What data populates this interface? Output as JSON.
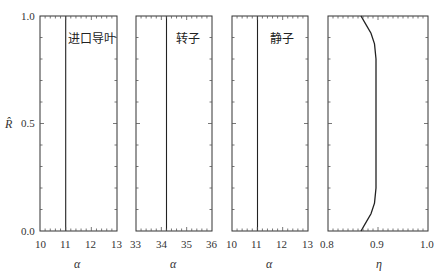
{
  "chart_data": [
    {
      "type": "line",
      "panel": 1,
      "title": "进口导叶",
      "xlabel": "α",
      "ylabel": "R̂",
      "xlim": [
        10,
        13
      ],
      "ylim": [
        0.0,
        1.0
      ],
      "xticks": [
        "10",
        "11",
        "12",
        "13"
      ],
      "yticks": [
        "0.0",
        "0.5",
        "1.0"
      ],
      "series": [
        {
          "name": "alpha",
          "x": [
            11.0,
            11.0
          ],
          "y": [
            0.0,
            1.0
          ]
        }
      ]
    },
    {
      "type": "line",
      "panel": 2,
      "title": "转子",
      "xlabel": "α",
      "xlim": [
        33,
        36
      ],
      "ylim": [
        0.0,
        1.0
      ],
      "xticks": [
        "33",
        "34",
        "35",
        "36"
      ],
      "series": [
        {
          "name": "alpha",
          "x": [
            34.2,
            34.2
          ],
          "y": [
            0.0,
            1.0
          ]
        }
      ]
    },
    {
      "type": "line",
      "panel": 3,
      "title": "静子",
      "xlabel": "α",
      "xlim": [
        10,
        13
      ],
      "ylim": [
        0.0,
        1.0
      ],
      "xticks": [
        "10",
        "11",
        "12",
        "13"
      ],
      "series": [
        {
          "name": "alpha",
          "x": [
            11.0,
            11.0
          ],
          "y": [
            0.0,
            1.0
          ]
        }
      ]
    },
    {
      "type": "line",
      "panel": 4,
      "title": "",
      "xlabel": "η",
      "xlim": [
        0.8,
        1.0
      ],
      "ylim": [
        0.0,
        1.0
      ],
      "xticks": [
        "0.8",
        "0.9",
        "1.0"
      ],
      "series": [
        {
          "name": "eta",
          "x": [
            0.866,
            0.876,
            0.886,
            0.893,
            0.896,
            0.896,
            0.896,
            0.893,
            0.886,
            0.876,
            0.866
          ],
          "y": [
            0.0,
            0.04,
            0.08,
            0.13,
            0.2,
            0.5,
            0.8,
            0.87,
            0.92,
            0.96,
            1.0
          ]
        }
      ]
    }
  ],
  "labels": {
    "ylabel": "R̂",
    "p1_title": "进口导叶",
    "p2_title": "转子",
    "p3_title": "静子",
    "p1_xlabel": "α",
    "p2_xlabel": "α",
    "p3_xlabel": "α",
    "p4_xlabel": "η",
    "yticks": [
      "0.0",
      "0.5",
      "1.0"
    ],
    "p1_xticks": [
      "10",
      "11",
      "12",
      "13"
    ],
    "p2_xticks": [
      "33",
      "34",
      "35",
      "36"
    ],
    "p3_xticks": [
      "10",
      "11",
      "12",
      "13"
    ],
    "p4_xticks": [
      "0.8",
      "0.9",
      "1.0"
    ]
  }
}
